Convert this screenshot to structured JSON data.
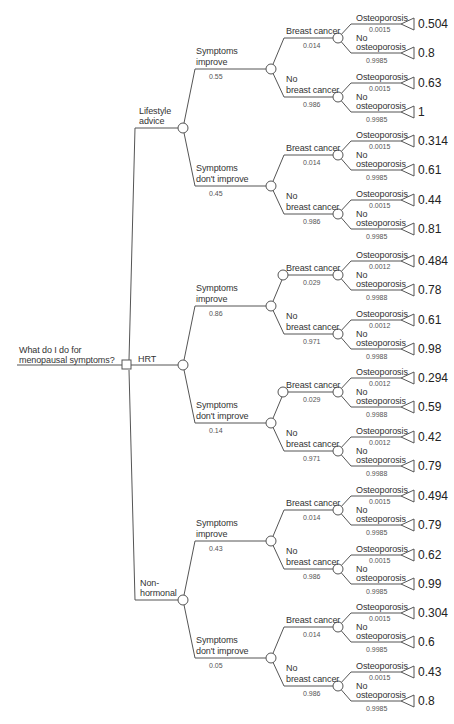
{
  "title": "What do I do for menopausal symptoms?",
  "root": {
    "label_line1": "What do I do for",
    "label_line2": "menopausal symptoms?",
    "node_type": "decision"
  },
  "options": [
    {
      "label": "Lifestyle advice",
      "label_line1": "Lifestyle",
      "label_line2": "advice",
      "outcomes": [
        {
          "label_line1": "Symptoms",
          "label_line2": "improve",
          "prob": "0.55",
          "branches": [
            {
              "label_line1": "",
              "label_line2": "Breast cancer",
              "prob": "0.014",
              "osteo": {
                "label": "Osteoporosis",
                "prob": "0.0015",
                "payoff": "0.504"
              },
              "no_osteo": {
                "label_line1": "No",
                "label_line2": "osteoporosis",
                "prob": "0.9985",
                "payoff": "0.8"
              }
            },
            {
              "label_line1": "No",
              "label_line2": "breast cancer",
              "prob": "0.986",
              "osteo": {
                "label": "Osteoporosis",
                "prob": "0.0015",
                "payoff": "0.63"
              },
              "no_osteo": {
                "label_line1": "No",
                "label_line2": "osteoporosis",
                "prob": "0.9985",
                "payoff": "1"
              }
            }
          ]
        },
        {
          "label_line1": "Symptoms",
          "label_line2": "don't improve",
          "prob": "0.45",
          "branches": [
            {
              "label_line1": "",
              "label_line2": "Breast cancer",
              "prob": "0.014",
              "osteo": {
                "label": "Osteoporosis",
                "prob": "0.0015",
                "payoff": "0.314"
              },
              "no_osteo": {
                "label_line1": "No",
                "label_line2": "osteoporosis",
                "prob": "0.9985",
                "payoff": "0.61"
              }
            },
            {
              "label_line1": "No",
              "label_line2": "breast cancer",
              "prob": "0.986",
              "osteo": {
                "label": "Osteoporosis",
                "prob": "0.0015",
                "payoff": "0.44"
              },
              "no_osteo": {
                "label_line1": "No",
                "label_line2": "osteoporosis",
                "prob": "0.9985",
                "payoff": "0.81"
              }
            }
          ]
        }
      ]
    },
    {
      "label": "HRT",
      "label_line1": "",
      "label_line2": "HRT",
      "outcomes": [
        {
          "label_line1": "Symptoms",
          "label_line2": "improve",
          "prob": "0.86",
          "branches": [
            {
              "label_line1": "",
              "label_line2": "Breast cancer",
              "prob": "0.029",
              "osteo": {
                "label": "Osteoporosis",
                "prob": "0.0012",
                "payoff": "0.484"
              },
              "no_osteo": {
                "label_line1": "No",
                "label_line2": "osteoporosis",
                "prob": "0.9988",
                "payoff": "0.78"
              }
            },
            {
              "label_line1": "No",
              "label_line2": "breast cancer",
              "prob": "0.971",
              "osteo": {
                "label": "Osteoporosis",
                "prob": "0.0012",
                "payoff": "0.61"
              },
              "no_osteo": {
                "label_line1": "No",
                "label_line2": "osteoporosis",
                "prob": "0.9988",
                "payoff": "0.98"
              }
            }
          ]
        },
        {
          "label_line1": "Symptoms",
          "label_line2": "don't improve",
          "prob": "0.14",
          "branches": [
            {
              "label_line1": "",
              "label_line2": "Breast cancer",
              "prob": "0.029",
              "osteo": {
                "label": "Osteoporosis",
                "prob": "0.0012",
                "payoff": "0.294"
              },
              "no_osteo": {
                "label_line1": "No",
                "label_line2": "osteoporosis",
                "prob": "0.9988",
                "payoff": "0.59"
              }
            },
            {
              "label_line1": "No",
              "label_line2": "breast cancer",
              "prob": "0.971",
              "osteo": {
                "label": "Osteoporosis",
                "prob": "0.0012",
                "payoff": "0.42"
              },
              "no_osteo": {
                "label_line1": "No",
                "label_line2": "osteoporosis",
                "prob": "0.9988",
                "payoff": "0.79"
              }
            }
          ]
        }
      ]
    },
    {
      "label": "Non-hormonal",
      "label_line1": "Non-",
      "label_line2": "hormonal",
      "outcomes": [
        {
          "label_line1": "Symptoms",
          "label_line2": "improve",
          "prob": "0.43",
          "branches": [
            {
              "label_line1": "",
              "label_line2": "Breast cancer",
              "prob": "0.014",
              "osteo": {
                "label": "Osteoporosis",
                "prob": "0.0015",
                "payoff": "0.494"
              },
              "no_osteo": {
                "label_line1": "No",
                "label_line2": "osteoporosis",
                "prob": "0.9985",
                "payoff": "0.79"
              }
            },
            {
              "label_line1": "No",
              "label_line2": "breast cancer",
              "prob": "0.986",
              "osteo": {
                "label": "Osteoporosis",
                "prob": "0.0015",
                "payoff": "0.62"
              },
              "no_osteo": {
                "label_line1": "No",
                "label_line2": "osteoporosis",
                "prob": "0.9985",
                "payoff": "0.99"
              }
            }
          ]
        },
        {
          "label_line1": "Symptoms",
          "label_line2": "don't improve",
          "prob": "0.05",
          "branches": [
            {
              "label_line1": "",
              "label_line2": "Breast cancer",
              "prob": "0.014",
              "osteo": {
                "label": "Osteoporosis",
                "prob": "0.0015",
                "payoff": "0.304"
              },
              "no_osteo": {
                "label_line1": "No",
                "label_line2": "osteoporosis",
                "prob": "0.9985",
                "payoff": "0.6"
              }
            },
            {
              "label_line1": "No",
              "label_line2": "breast cancer",
              "prob": "0.986",
              "osteo": {
                "label": "Osteoporosis",
                "prob": "0.0015",
                "payoff": "0.43"
              },
              "no_osteo": {
                "label_line1": "No",
                "label_line2": "osteoporosis",
                "prob": "0.9985",
                "payoff": "0.8"
              }
            }
          ]
        }
      ]
    }
  ],
  "colors": {
    "line": "#555555",
    "text": "#333333",
    "background": "#ffffff"
  }
}
